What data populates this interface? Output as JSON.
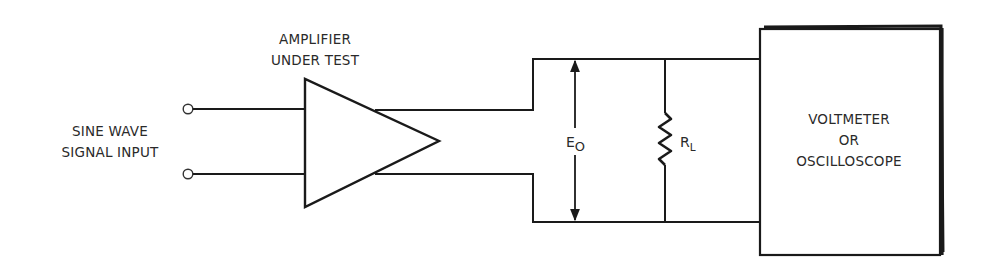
{
  "diagram": {
    "input_label": {
      "line1": "SINE WAVE",
      "line2": "SIGNAL INPUT"
    },
    "amplifier_label": {
      "line1": "AMPLIFIER",
      "line2": "UNDER TEST"
    },
    "output_voltage": {
      "symbol": "E",
      "subscript": "O"
    },
    "load_resistor": {
      "symbol": "R",
      "subscript": "L"
    },
    "instrument_label": {
      "line1": "VOLTMETER",
      "line2": "OR",
      "line3": "OSCILLOSCOPE"
    },
    "colors": {
      "ink": "#1a1a1a",
      "background": "#ffffff"
    }
  }
}
